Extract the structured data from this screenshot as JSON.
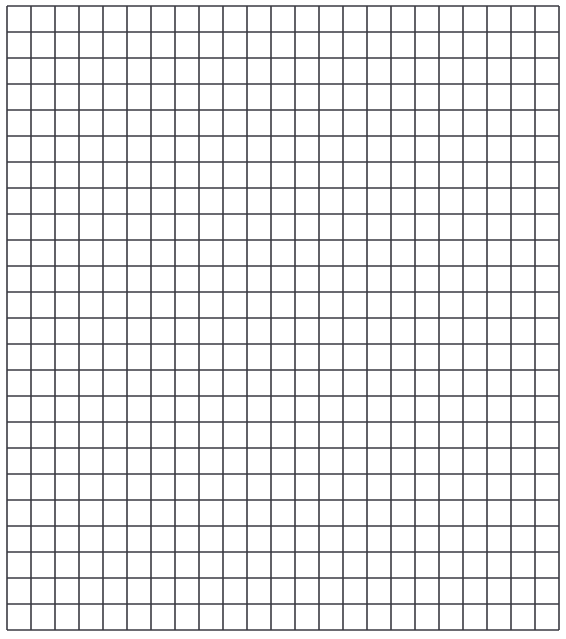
{
  "grid": {
    "columns": 23,
    "rows": 24,
    "origin_x": 7,
    "origin_y": 6,
    "cell_width": 24,
    "cell_height": 26,
    "line_color": "#3a3a42",
    "line_width": 1.6,
    "background": "#ffffff"
  }
}
